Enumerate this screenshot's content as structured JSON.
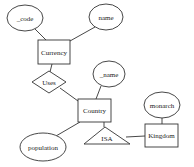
{
  "diagram": {
    "type": "ER diagram",
    "entities": [
      {
        "id": "currency",
        "label": "Currency"
      },
      {
        "id": "country",
        "label": "Country"
      },
      {
        "id": "kingdom",
        "label": "Kingdom"
      }
    ],
    "attributes": [
      {
        "id": "code",
        "label": "_code",
        "of": "currency"
      },
      {
        "id": "cname",
        "label": "name",
        "of": "currency"
      },
      {
        "id": "countryname",
        "label": "_name",
        "of": "country"
      },
      {
        "id": "population",
        "label": "population",
        "of": "country"
      },
      {
        "id": "monarch",
        "label": "monarch",
        "of": "kingdom"
      }
    ],
    "relationships": [
      {
        "id": "uses",
        "label": "Uses",
        "connects": [
          "currency",
          "country"
        ]
      }
    ],
    "isa": {
      "label": "ISA",
      "parent": "country",
      "child": "kingdom"
    }
  }
}
